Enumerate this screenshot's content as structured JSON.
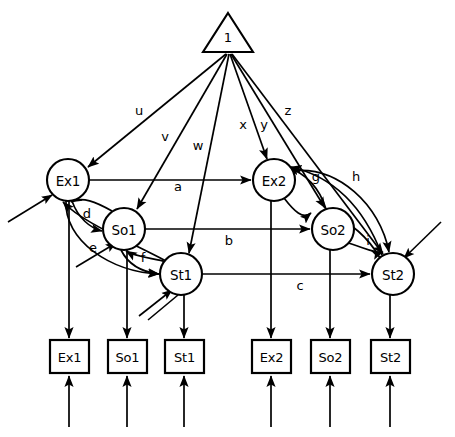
{
  "figure": {
    "type": "node-link-diagram",
    "background_color": "#ffffff",
    "stroke_color": "#000000",
    "width": 455,
    "height": 437
  },
  "source_node": {
    "id": "constant",
    "shape": "triangle",
    "label": "1",
    "cx": 228,
    "cy": 35
  },
  "latent_nodes": [
    {
      "id": "Ex1",
      "label": "Ex1",
      "cx": 68,
      "cy": 180,
      "r": 21
    },
    {
      "id": "So1",
      "label": "So1",
      "cx": 124,
      "cy": 229,
      "r": 21
    },
    {
      "id": "St1",
      "label": "St1",
      "cx": 181,
      "cy": 274,
      "r": 21
    },
    {
      "id": "Ex2",
      "label": "Ex2",
      "cx": 274,
      "cy": 180,
      "r": 21
    },
    {
      "id": "So2",
      "label": "So2",
      "cx": 333,
      "cy": 229,
      "r": 21
    },
    {
      "id": "St2",
      "label": "St2",
      "cx": 393,
      "cy": 274,
      "r": 21
    }
  ],
  "observed_nodes": [
    {
      "id": "box-Ex1",
      "label": "Ex1",
      "x": 50,
      "y": 340,
      "w": 39,
      "h": 33
    },
    {
      "id": "box-So1",
      "label": "So1",
      "x": 108,
      "y": 340,
      "w": 39,
      "h": 33
    },
    {
      "id": "box-St1",
      "label": "St1",
      "x": 165,
      "y": 340,
      "w": 39,
      "h": 33
    },
    {
      "id": "box-Ex2",
      "label": "Ex2",
      "x": 252,
      "y": 340,
      "w": 39,
      "h": 33
    },
    {
      "id": "box-So2",
      "label": "So2",
      "x": 311,
      "y": 340,
      "w": 39,
      "h": 33
    },
    {
      "id": "box-St2",
      "label": "St2",
      "x": 371,
      "y": 340,
      "w": 39,
      "h": 33
    }
  ],
  "edge_labels": {
    "u": "u",
    "v": "v",
    "w": "w",
    "x": "x",
    "y": "y",
    "z": "z",
    "a": "a",
    "b": "b",
    "c": "c",
    "d": "d",
    "e": "e",
    "f": "f",
    "g": "g",
    "h": "h",
    "i": "i"
  },
  "edge_label_positions": [
    {
      "key": "u",
      "x": 139,
      "y": 110
    },
    {
      "key": "v",
      "x": 165,
      "y": 136
    },
    {
      "key": "w",
      "x": 198,
      "y": 145
    },
    {
      "key": "x",
      "x": 243,
      "y": 124
    },
    {
      "key": "y",
      "x": 264,
      "y": 124
    },
    {
      "key": "z",
      "x": 288,
      "y": 110
    },
    {
      "key": "a",
      "x": 178,
      "y": 184
    },
    {
      "key": "b",
      "x": 229,
      "y": 237
    },
    {
      "key": "c",
      "x": 300,
      "y": 282
    },
    {
      "key": "d",
      "x": 87,
      "y": 213
    },
    {
      "key": "e",
      "x": 93,
      "y": 247
    },
    {
      "key": "f",
      "x": 143,
      "y": 257
    },
    {
      "key": "g",
      "x": 316,
      "y": 175
    },
    {
      "key": "h",
      "x": 356,
      "y": 175
    },
    {
      "key": "i",
      "x": 368,
      "y": 239
    }
  ],
  "edges": [
    {
      "from": "constant",
      "to": "Ex1",
      "label": "u"
    },
    {
      "from": "constant",
      "to": "So1",
      "label": "v"
    },
    {
      "from": "constant",
      "to": "St1",
      "label": "w"
    },
    {
      "from": "constant",
      "to": "Ex2",
      "label": "x"
    },
    {
      "from": "constant",
      "to": "So2",
      "label": "y"
    },
    {
      "from": "constant",
      "to": "St2",
      "label": "z"
    },
    {
      "from": "Ex1",
      "to": "Ex2",
      "label": "a"
    },
    {
      "from": "So1",
      "to": "So2",
      "label": "b"
    },
    {
      "from": "St1",
      "to": "St2",
      "label": "c"
    },
    {
      "from": "Ex1",
      "to": "So1",
      "label": "d"
    },
    {
      "from": "Ex1",
      "to": "St1",
      "label": "e"
    },
    {
      "from": "So1",
      "to": "St1",
      "label": "f"
    },
    {
      "from": "Ex2",
      "to": "So2",
      "label": "g"
    },
    {
      "from": "Ex2",
      "to": "St2",
      "label": "h"
    },
    {
      "from": "So2",
      "to": "St2",
      "label": "i"
    },
    {
      "from": "So1",
      "to": "Ex1",
      "label": ""
    },
    {
      "from": "St1",
      "to": "Ex1",
      "label": ""
    },
    {
      "from": "St1",
      "to": "So1",
      "label": ""
    },
    {
      "from": "So2",
      "to": "Ex2",
      "label": ""
    },
    {
      "from": "St2",
      "to": "Ex2",
      "label": ""
    },
    {
      "from": "St2",
      "to": "So2",
      "label": ""
    }
  ],
  "measurement_edges": [
    {
      "from": "Ex1",
      "to": "box-Ex1"
    },
    {
      "from": "So1",
      "to": "box-So1"
    },
    {
      "from": "St1",
      "to": "box-St1"
    },
    {
      "from": "Ex2",
      "to": "box-Ex2"
    },
    {
      "from": "So2",
      "to": "box-So2"
    },
    {
      "from": "St2",
      "to": "box-St2"
    }
  ],
  "residual_arrows_into_boxes": [
    "box-Ex1",
    "box-So1",
    "box-St1",
    "box-Ex2",
    "box-So2",
    "box-St2"
  ],
  "disturbance_arrows_into_latents": [
    "Ex1",
    "So1",
    "St1",
    "St2"
  ]
}
